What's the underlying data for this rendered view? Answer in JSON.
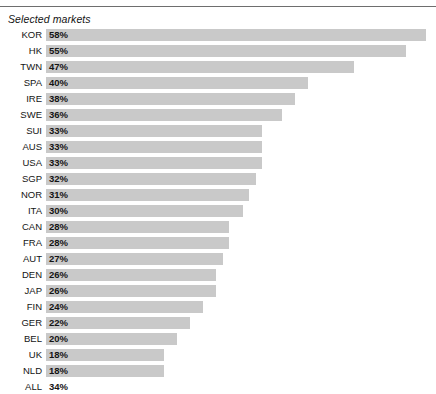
{
  "title": "Selected markets",
  "colors": {
    "bar": "#c9c9c9",
    "rule": "#6e6e6e",
    "text": "#141414",
    "background": "#ffffff"
  },
  "chart_data": {
    "type": "bar",
    "orientation": "horizontal",
    "title": "Selected markets",
    "xlabel": "",
    "ylabel": "",
    "grid": false,
    "legend": null,
    "xlim": [
      0,
      60
    ],
    "value_suffix": "%",
    "categories": [
      "KOR",
      "HK",
      "TWN",
      "SPA",
      "IRE",
      "SWE",
      "SUI",
      "AUS",
      "USA",
      "SGP",
      "NOR",
      "ITA",
      "CAN",
      "FRA",
      "AUT",
      "DEN",
      "JAP",
      "FIN",
      "GER",
      "BEL",
      "UK",
      "NLD",
      "ALL"
    ],
    "values": [
      58,
      55,
      47,
      40,
      38,
      36,
      33,
      33,
      33,
      32,
      31,
      30,
      28,
      28,
      27,
      26,
      26,
      24,
      22,
      20,
      18,
      18,
      34
    ],
    "labels": [
      "58%",
      "55%",
      "47%",
      "40%",
      "38%",
      "36%",
      "33%",
      "33%",
      "33%",
      "32%",
      "31%",
      "30%",
      "28%",
      "28%",
      "27%",
      "26%",
      "26%",
      "24%",
      "22%",
      "20%",
      "18%",
      "18%",
      "34%"
    ],
    "bars_drawn": [
      true,
      true,
      true,
      true,
      true,
      true,
      true,
      true,
      true,
      true,
      true,
      true,
      true,
      true,
      true,
      true,
      true,
      true,
      true,
      true,
      true,
      true,
      false
    ]
  },
  "rows": [
    {
      "label": "KOR",
      "value": "58%",
      "pct": 58,
      "bar": true
    },
    {
      "label": "HK",
      "value": "55%",
      "pct": 55,
      "bar": true
    },
    {
      "label": "TWN",
      "value": "47%",
      "pct": 47,
      "bar": true
    },
    {
      "label": "SPA",
      "value": "40%",
      "pct": 40,
      "bar": true
    },
    {
      "label": "IRE",
      "value": "38%",
      "pct": 38,
      "bar": true
    },
    {
      "label": "SWE",
      "value": "36%",
      "pct": 36,
      "bar": true
    },
    {
      "label": "SUI",
      "value": "33%",
      "pct": 33,
      "bar": true
    },
    {
      "label": "AUS",
      "value": "33%",
      "pct": 33,
      "bar": true
    },
    {
      "label": "USA",
      "value": "33%",
      "pct": 33,
      "bar": true
    },
    {
      "label": "SGP",
      "value": "32%",
      "pct": 32,
      "bar": true
    },
    {
      "label": "NOR",
      "value": "31%",
      "pct": 31,
      "bar": true
    },
    {
      "label": "ITA",
      "value": "30%",
      "pct": 30,
      "bar": true
    },
    {
      "label": "CAN",
      "value": "28%",
      "pct": 28,
      "bar": true
    },
    {
      "label": "FRA",
      "value": "28%",
      "pct": 28,
      "bar": true
    },
    {
      "label": "AUT",
      "value": "27%",
      "pct": 27,
      "bar": true
    },
    {
      "label": "DEN",
      "value": "26%",
      "pct": 26,
      "bar": true
    },
    {
      "label": "JAP",
      "value": "26%",
      "pct": 26,
      "bar": true
    },
    {
      "label": "FIN",
      "value": "24%",
      "pct": 24,
      "bar": true
    },
    {
      "label": "GER",
      "value": "22%",
      "pct": 22,
      "bar": true
    },
    {
      "label": "BEL",
      "value": "20%",
      "pct": 20,
      "bar": true
    },
    {
      "label": "UK",
      "value": "18%",
      "pct": 18,
      "bar": true
    },
    {
      "label": "NLD",
      "value": "18%",
      "pct": 18,
      "bar": true
    },
    {
      "label": "ALL",
      "value": "34%",
      "pct": 34,
      "bar": false
    }
  ]
}
